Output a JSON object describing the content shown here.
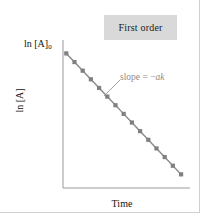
{
  "figure": {
    "background_color": "#ffffff",
    "border_color": "#cfcfcf"
  },
  "legend": {
    "label": "First order",
    "box_color": "#d9d9d9",
    "text_color": "#1a1a1a"
  },
  "annotations": {
    "origin_value_prefix": "ln [A]",
    "origin_value_subscript": "0",
    "slope_text": "slope = −",
    "slope_variable": "ak",
    "slope_text_color": "#8c8c8c",
    "leader_line_color": "#9a9a9a"
  },
  "chart_data": {
    "type": "line",
    "title": "",
    "subtitle": "",
    "xlabel": "Time",
    "ylabel": "ln [A]",
    "grid": false,
    "legend_position": "top-right",
    "legend_entries": [
      "First order"
    ],
    "axis_color": "#9a9a9a",
    "series": [
      {
        "name": "First order",
        "line_color": "#8a8a8a",
        "marker_color": "#808080",
        "marker_shape": "square",
        "x": [
          0,
          1,
          2,
          3,
          4,
          5,
          6,
          7,
          8,
          9,
          10,
          11,
          12,
          13,
          14
        ],
        "y": [
          10.0,
          9.3,
          8.6,
          7.9,
          7.2,
          6.5,
          5.8,
          5.1,
          4.4,
          3.7,
          3.0,
          2.3,
          1.6,
          0.9,
          0.2
        ]
      }
    ],
    "xlim": [
      -0.4,
      14.6
    ],
    "ylim": [
      -0.5,
      10.6
    ],
    "xticks": [],
    "yticks": [],
    "annotation_points": [
      {
        "label": "ln [A]0",
        "x": 0,
        "y": 10.0
      },
      {
        "label": "slope = -ak",
        "x": 3,
        "y": 7.9
      }
    ]
  }
}
